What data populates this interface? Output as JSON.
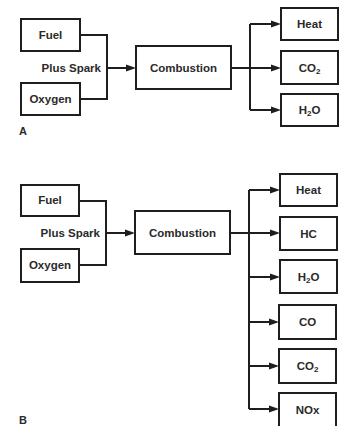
{
  "diagram": {
    "panels": [
      {
        "id": "A",
        "label": "A",
        "inputs": [
          "Fuel",
          "Oxygen"
        ],
        "join_label": "Plus Spark",
        "process": "Combustion",
        "outputs": [
          {
            "text": "Heat",
            "main": "Heat",
            "sub": "",
            "tail": ""
          },
          {
            "text": "CO2",
            "main": "CO",
            "sub": "2",
            "tail": ""
          },
          {
            "text": "H2O",
            "main": "H",
            "sub": "2",
            "tail": "O"
          }
        ]
      },
      {
        "id": "B",
        "label": "B",
        "inputs": [
          "Fuel",
          "Oxygen"
        ],
        "join_label": "Plus Spark",
        "process": "Combustion",
        "outputs": [
          {
            "text": "Heat",
            "main": "Heat",
            "sub": "",
            "tail": ""
          },
          {
            "text": "HC",
            "main": "HC",
            "sub": "",
            "tail": ""
          },
          {
            "text": "H2O",
            "main": "H",
            "sub": "2",
            "tail": "O"
          },
          {
            "text": "CO",
            "main": "CO",
            "sub": "",
            "tail": ""
          },
          {
            "text": "CO2",
            "main": "CO",
            "sub": "2",
            "tail": ""
          },
          {
            "text": "NOx",
            "main": "NOx",
            "sub": "",
            "tail": ""
          }
        ]
      }
    ],
    "colors": {
      "line": "#1e1e1e",
      "text": "#2a2a2a",
      "background": "#ffffff"
    }
  }
}
